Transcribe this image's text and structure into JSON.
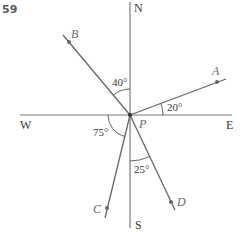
{
  "question_number": "59",
  "compass": {
    "north": "N",
    "south": "S",
    "east": "E",
    "west": "W"
  },
  "center_label": "P",
  "points": [
    {
      "label": "A",
      "bearing_deg": 70,
      "angle_label": "20°",
      "angle_description": "20° above East"
    },
    {
      "label": "B",
      "bearing_deg": 320,
      "angle_label": "40°",
      "angle_description": "40° west of North"
    },
    {
      "label": "C",
      "bearing_deg": 195,
      "angle_label": "75°",
      "angle_description": "75° below West"
    },
    {
      "label": "D",
      "bearing_deg": 155,
      "angle_label": "25°",
      "angle_description": "25° east of South"
    }
  ],
  "colors": {
    "lines": "#666666",
    "text": "#3a3a3a",
    "point_labels": "#6a6a6a"
  }
}
